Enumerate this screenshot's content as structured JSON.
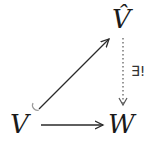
{
  "diagram": {
    "type": "commutative-diagram",
    "nodes": {
      "source": {
        "label": "V"
      },
      "target": {
        "label": "W"
      },
      "completion": {
        "label": "V̂"
      }
    },
    "edges": [
      {
        "from": "V",
        "to": "V̂",
        "style": "hook-arrow (inclusion)",
        "label": ""
      },
      {
        "from": "V",
        "to": "W",
        "style": "solid arrow",
        "label": ""
      },
      {
        "from": "V̂",
        "to": "W",
        "style": "dotted arrow",
        "label": "∃!"
      }
    ],
    "unique_label": "∃!",
    "colors": {
      "ink": "#1a1a1a",
      "background": "#ffffff"
    }
  }
}
